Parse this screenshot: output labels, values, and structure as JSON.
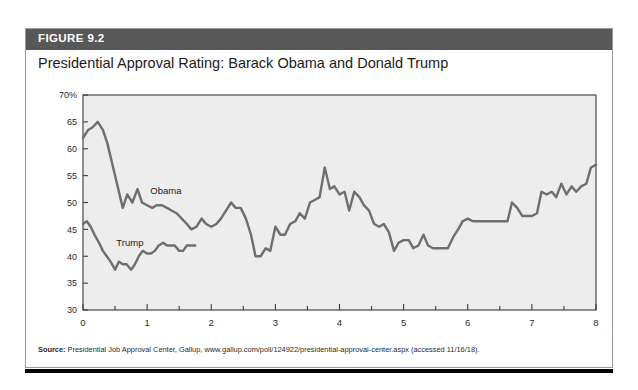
{
  "figure": {
    "number_label": "FIGURE 9.2",
    "title": "Presidential Approval Rating: Barack Obama and Donald Trump",
    "source_label": "Source:",
    "source_text": " Presidential Job Approval Center, Gallup, www.gallup.com/poll/124922/presidential-approval-center.aspx (accessed 11/16/18)."
  },
  "colors": {
    "header_bar": "#585858",
    "plot_background": "#ededed",
    "line": "#6e6e6e",
    "axis": "#3a3a3a",
    "border": "#9a9a9a"
  },
  "chart_data": {
    "type": "line",
    "title": "Presidential Approval Rating: Barack Obama and Donald Trump",
    "xlabel": "",
    "ylabel": "",
    "xlim": [
      0,
      8
    ],
    "ylim": [
      30,
      70
    ],
    "grid": false,
    "legend": "inline-labels",
    "xticks": [
      0,
      1,
      2,
      3,
      4,
      5,
      6,
      7,
      8
    ],
    "xticklabels": [
      "0",
      "1",
      "2",
      "3",
      "4",
      "5",
      "6",
      "7",
      "8"
    ],
    "xminor_step": 0.5,
    "yticks": [
      30,
      35,
      40,
      45,
      50,
      55,
      60,
      65,
      70
    ],
    "yticklabels": [
      "30",
      "35",
      "40",
      "45",
      "50",
      "55",
      "60",
      "65",
      "70%"
    ],
    "annotations": [
      {
        "text": "Obama",
        "x": 1.05,
        "y": 51.5
      },
      {
        "text": "Trump",
        "x": 0.52,
        "y": 42.0
      }
    ],
    "series": [
      {
        "name": "Obama",
        "color": "#6e6e6e",
        "x": [
          0.0,
          0.08,
          0.15,
          0.23,
          0.31,
          0.38,
          0.46,
          0.54,
          0.62,
          0.69,
          0.77,
          0.85,
          0.92,
          1.0,
          1.08,
          1.15,
          1.23,
          1.31,
          1.38,
          1.46,
          1.54,
          1.62,
          1.69,
          1.77,
          1.85,
          1.92,
          2.0,
          2.08,
          2.15,
          2.23,
          2.31,
          2.38,
          2.46,
          2.54,
          2.62,
          2.69,
          2.77,
          2.85,
          2.92,
          3.0,
          3.08,
          3.15,
          3.23,
          3.31,
          3.38,
          3.46,
          3.54,
          3.62,
          3.69,
          3.77,
          3.85,
          3.92,
          4.0,
          4.08,
          4.15,
          4.23,
          4.31,
          4.38,
          4.46,
          4.54,
          4.62,
          4.69,
          4.77,
          4.85,
          4.92,
          5.0,
          5.08,
          5.15,
          5.23,
          5.31,
          5.38,
          5.46,
          5.54,
          5.62,
          5.69,
          5.77,
          5.85,
          5.92,
          6.0,
          6.08,
          6.15,
          6.23,
          6.31,
          6.38,
          6.46,
          6.54,
          6.62,
          6.69,
          6.77,
          6.85,
          6.92,
          7.0,
          7.08,
          7.15,
          7.23,
          7.31,
          7.38,
          7.46,
          7.54,
          7.62,
          7.69,
          7.77,
          7.85,
          7.92,
          8.0
        ],
        "y": [
          62.0,
          63.5,
          64.0,
          65.0,
          63.5,
          61.0,
          57.0,
          53.0,
          49.0,
          51.5,
          50.0,
          52.5,
          50.0,
          49.5,
          49.0,
          49.5,
          49.5,
          49.0,
          48.5,
          48.0,
          47.0,
          46.0,
          45.0,
          45.5,
          47.0,
          46.0,
          45.5,
          46.0,
          47.0,
          48.5,
          50.0,
          49.0,
          49.0,
          47.0,
          44.0,
          40.0,
          40.0,
          41.5,
          41.0,
          45.5,
          44.0,
          44.0,
          46.0,
          46.5,
          48.0,
          47.0,
          50.0,
          50.5,
          51.0,
          56.5,
          52.5,
          53.0,
          51.5,
          52.0,
          48.5,
          52.0,
          51.0,
          49.5,
          48.5,
          46.0,
          45.5,
          46.0,
          44.5,
          41.0,
          42.5,
          43.0,
          43.0,
          41.5,
          42.0,
          44.0,
          42.0,
          41.5,
          41.5,
          41.5,
          41.5,
          43.5,
          45.0,
          46.5,
          47.0,
          46.5,
          46.5,
          46.5,
          46.5,
          46.5,
          46.5,
          46.5,
          46.5,
          50.0,
          49.0,
          47.5,
          47.5,
          47.5,
          48.0,
          52.0,
          51.5,
          52.0,
          51.0,
          53.5,
          51.5,
          53.0,
          52.0,
          53.0,
          53.5,
          56.5,
          57.0
        ]
      },
      {
        "name": "Trump",
        "color": "#6e6e6e",
        "x": [
          0.0,
          0.06,
          0.12,
          0.18,
          0.25,
          0.31,
          0.37,
          0.43,
          0.5,
          0.56,
          0.62,
          0.68,
          0.75,
          0.81,
          0.87,
          0.93,
          1.0,
          1.06,
          1.12,
          1.18,
          1.25,
          1.31,
          1.37,
          1.43,
          1.5,
          1.56,
          1.62,
          1.68,
          1.75
        ],
        "y": [
          46.0,
          46.5,
          45.5,
          44.0,
          42.5,
          41.0,
          40.0,
          39.0,
          37.5,
          39.0,
          38.5,
          38.5,
          37.5,
          38.5,
          40.0,
          41.0,
          40.5,
          40.5,
          41.0,
          42.0,
          42.5,
          42.0,
          42.0,
          42.0,
          41.0,
          41.0,
          42.0,
          42.0,
          42.0
        ]
      }
    ]
  }
}
